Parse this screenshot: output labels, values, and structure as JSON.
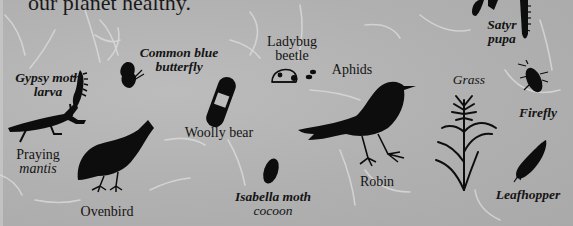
{
  "headline": "our planet healthy.",
  "background_color": "#b1b1b1",
  "silhouette_color": "#0d0d0d",
  "organisms": [
    {
      "id": "gypsy-moth-larva",
      "label_lines": [
        "Gypsy moth",
        "larva"
      ],
      "style": "italic"
    },
    {
      "id": "praying-mantis",
      "label_lines": [
        "Praying",
        "mantis"
      ],
      "style": "mixed"
    },
    {
      "id": "common-blue-butterfly",
      "label_lines": [
        "Common blue",
        "butterfly"
      ],
      "style": "italic"
    },
    {
      "id": "woolly-bear",
      "label_lines": [
        "Woolly bear"
      ],
      "style": "roman"
    },
    {
      "id": "ladybug-beetle",
      "label_lines": [
        "Ladybug",
        "beetle"
      ],
      "style": "roman"
    },
    {
      "id": "aphids",
      "label_lines": [
        "Aphids"
      ],
      "style": "roman"
    },
    {
      "id": "robin",
      "label_lines": [
        "Robin"
      ],
      "style": "roman"
    },
    {
      "id": "ovenbird",
      "label_lines": [
        "Ovenbird"
      ],
      "style": "roman"
    },
    {
      "id": "isabella-moth-cocoon",
      "label_lines": [
        "Isabella moth",
        "cocoon"
      ],
      "style": "italic"
    },
    {
      "id": "satyr-pupa",
      "label_lines": [
        "Satyr",
        "pupa"
      ],
      "style": "italic"
    },
    {
      "id": "grass",
      "label_lines": [
        "Grass"
      ],
      "style": "italic"
    },
    {
      "id": "firefly",
      "label_lines": [
        "Firefly"
      ],
      "style": "italic"
    },
    {
      "id": "leafhopper",
      "label_lines": [
        "Leafhopper"
      ],
      "style": "italic"
    }
  ]
}
